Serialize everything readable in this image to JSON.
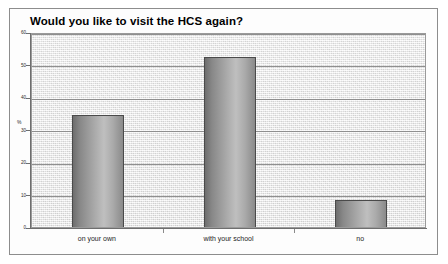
{
  "chart_data": {
    "type": "bar",
    "title": "Would you like to visit the HCS again?",
    "xlabel": "",
    "ylabel": "%",
    "categories": [
      "on your own",
      "with your school",
      "no"
    ],
    "values": [
      35,
      53,
      9
    ],
    "ylim": [
      0,
      60
    ],
    "yticks": [
      0,
      10,
      20,
      30,
      40,
      50,
      60
    ],
    "ytick_labels": [
      "0",
      "10",
      "20",
      "30",
      "40",
      "50",
      "60"
    ],
    "grid": true,
    "legend": "none",
    "series": [
      {
        "name": "percent of respondents",
        "values": [
          35,
          53,
          9
        ]
      }
    ],
    "colors": {
      "bar_fill_light": "#bfbfbf",
      "bar_fill_dark": "#6e6e6e",
      "bar_outline": "#4a4a4a",
      "plot_background": "#ececec",
      "gridline": "#8f8f8f",
      "axis": "#6e6e6e",
      "text": "#000000"
    }
  }
}
